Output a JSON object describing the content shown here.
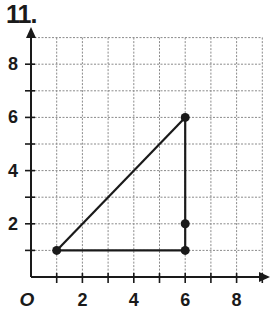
{
  "problem_number": "11.",
  "chart_data": {
    "type": "scatter",
    "title": "",
    "xlabel": "",
    "ylabel": "",
    "xlim": [
      0,
      9
    ],
    "ylim": [
      0,
      9
    ],
    "grid": true,
    "origin_label": "O",
    "x_tick_labels": [
      "2",
      "4",
      "6",
      "8"
    ],
    "x_tick_values": [
      2,
      4,
      6,
      8
    ],
    "y_tick_labels": [
      "2",
      "4",
      "6",
      "8"
    ],
    "y_tick_values": [
      2,
      4,
      6,
      8
    ],
    "points": [
      {
        "x": 1,
        "y": 1
      },
      {
        "x": 6,
        "y": 1
      },
      {
        "x": 6,
        "y": 2
      },
      {
        "x": 6,
        "y": 6
      }
    ],
    "segments": [
      {
        "from": [
          1,
          1
        ],
        "to": [
          6,
          6
        ]
      },
      {
        "from": [
          6,
          6
        ],
        "to": [
          6,
          1
        ]
      },
      {
        "from": [
          6,
          1
        ],
        "to": [
          1,
          1
        ]
      }
    ],
    "shape": "right triangle with vertices (1,1), (6,1), (6,6)"
  }
}
